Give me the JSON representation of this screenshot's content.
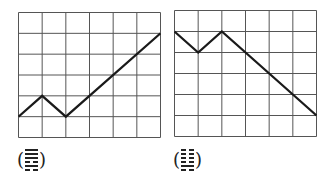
{
  "diagram": {
    "grid": {
      "cols": 6,
      "rows": 6,
      "line_color": "#555555",
      "path_color": "#1a1a1a"
    },
    "panels": [
      {
        "id": "left",
        "points": [
          [
            0,
            1
          ],
          [
            1,
            2
          ],
          [
            2,
            1
          ],
          [
            6,
            5
          ]
        ],
        "label_open": "(",
        "label_close": ")",
        "hexagram_lines_top_to_bottom": [
          1,
          1,
          1,
          0,
          1,
          0
        ],
        "hexagram_name": "Song (Qian over Kan)"
      },
      {
        "id": "right",
        "points": [
          [
            0,
            5
          ],
          [
            1,
            4
          ],
          [
            2,
            5
          ],
          [
            6,
            1
          ]
        ],
        "label_open": "(",
        "label_close": ")",
        "hexagram_lines_top_to_bottom": [
          0,
          0,
          0,
          0,
          1,
          0
        ],
        "hexagram_name": "Shi (Kun over Kan)"
      }
    ]
  }
}
